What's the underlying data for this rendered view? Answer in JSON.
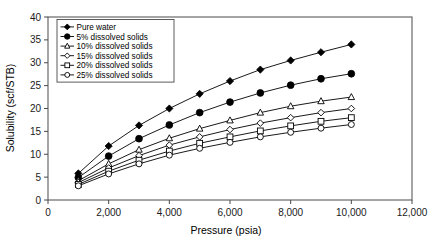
{
  "chart_data": {
    "type": "line",
    "title": "",
    "xlabel": "Pressure (psia)",
    "ylabel": "Solubility (scf/STB)",
    "xlim": [
      0,
      12000
    ],
    "ylim": [
      0,
      40
    ],
    "xticks": [
      0,
      2000,
      4000,
      6000,
      8000,
      10000,
      12000
    ],
    "xtick_labels": [
      "0",
      "2,000",
      "4,000",
      "6,000",
      "8,000",
      "10,000",
      "12,000"
    ],
    "yticks": [
      0,
      5,
      10,
      15,
      20,
      25,
      30,
      35,
      40
    ],
    "ytick_labels": [
      "0",
      "5",
      "10",
      "15",
      "20",
      "25",
      "30",
      "35",
      "40"
    ],
    "grid": false,
    "legend_position": "upper-left-inside",
    "x": [
      1000,
      2000,
      3000,
      4000,
      5000,
      6000,
      7000,
      8000,
      9000,
      10000
    ],
    "series": [
      {
        "name": "Pure water",
        "marker": "filled-diamond",
        "values": [
          5.8,
          11.8,
          16.3,
          20.0,
          23.2,
          26.0,
          28.5,
          30.5,
          32.3,
          34.0
        ]
      },
      {
        "name": "5% dissolved solids",
        "marker": "filled-circle",
        "values": [
          4.9,
          9.6,
          13.4,
          16.4,
          19.1,
          21.4,
          23.4,
          25.1,
          26.5,
          27.6
        ]
      },
      {
        "name": "10% dissolved solids",
        "marker": "open-triangle",
        "values": [
          4.2,
          7.9,
          11.0,
          13.5,
          15.6,
          17.4,
          19.1,
          20.5,
          21.6,
          22.5
        ]
      },
      {
        "name": "15% dissolved solids",
        "marker": "open-diamond",
        "values": [
          3.8,
          7.0,
          9.7,
          12.0,
          13.8,
          15.4,
          16.8,
          18.0,
          19.1,
          20.0
        ]
      },
      {
        "name": "20% dissolved solids",
        "marker": "open-square",
        "values": [
          3.4,
          6.3,
          8.7,
          10.7,
          12.4,
          13.8,
          15.1,
          16.2,
          17.2,
          18.0
        ]
      },
      {
        "name": "25% dissolved solids",
        "marker": "open-circle",
        "values": [
          3.1,
          5.7,
          7.9,
          9.8,
          11.3,
          12.6,
          13.8,
          14.8,
          15.7,
          16.5
        ]
      }
    ]
  },
  "legend": {
    "entries": [
      {
        "label": "Pure water"
      },
      {
        "label": "5% dissolved solids"
      },
      {
        "label": "10% dissolved solids"
      },
      {
        "label": "15% dissolved solids"
      },
      {
        "label": "20% dissolved solids"
      },
      {
        "label": "25% dissolved solids"
      }
    ]
  },
  "colors": {
    "ink": "#000000",
    "axis": "#4a4a4a",
    "background": "#ffffff"
  }
}
